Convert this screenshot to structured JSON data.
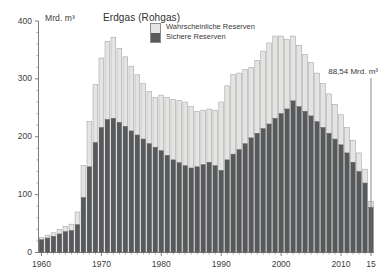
{
  "chart": {
    "title": "Erdgas (Rohgas)",
    "unit_label": "Mrd. m³",
    "annotation": "88,54 Mrd. m³",
    "legend": {
      "items": [
        {
          "label": "Wahrscheinliche Reserven",
          "color": "#e4e4e2",
          "key": "wahrscheinliche"
        },
        {
          "label": "Sichere Reserven",
          "color": "#58595b",
          "key": "sichere"
        }
      ]
    },
    "axis": {
      "y_ticks": [
        "0",
        "100",
        "200",
        "300",
        "400"
      ],
      "x_ticks": [
        "1960",
        "1970",
        "1980",
        "1990",
        "2000",
        "2010",
        "15"
      ]
    },
    "colors": {
      "light": "#e4e4e2",
      "dark": "#58595b",
      "bar_stroke": "#9a9a9a",
      "axis": "#6e6e6e",
      "text": "#3a3a3a"
    }
  },
  "chart_data": {
    "type": "bar",
    "stacked": true,
    "title": "Erdgas (Rohgas)",
    "xlabel": "",
    "ylabel": "Mrd. m³",
    "ylim": [
      0,
      400
    ],
    "yticks": [
      0,
      100,
      200,
      300,
      400
    ],
    "grid": false,
    "legend_position": "top-center",
    "annotations": [
      {
        "text": "88,54 Mrd. m³",
        "x": 2015,
        "note": "letzter Wert / Gesamtreserven 2015"
      }
    ],
    "categories": [
      1960,
      1961,
      1962,
      1963,
      1964,
      1965,
      1966,
      1967,
      1968,
      1969,
      1970,
      1971,
      1972,
      1973,
      1974,
      1975,
      1976,
      1977,
      1978,
      1979,
      1980,
      1981,
      1982,
      1983,
      1984,
      1985,
      1986,
      1987,
      1988,
      1989,
      1990,
      1991,
      1992,
      1993,
      1994,
      1995,
      1996,
      1997,
      1998,
      1999,
      2000,
      2001,
      2002,
      2003,
      2004,
      2005,
      2006,
      2007,
      2008,
      2009,
      2010,
      2011,
      2012,
      2013,
      2014,
      2015
    ],
    "series": [
      {
        "name": "Sichere Reserven",
        "color": "#58595b",
        "values": [
          22,
          25,
          28,
          32,
          36,
          38,
          48,
          95,
          148,
          190,
          216,
          230,
          232,
          225,
          218,
          210,
          203,
          196,
          188,
          182,
          176,
          168,
          160,
          155,
          150,
          146,
          148,
          152,
          156,
          150,
          142,
          160,
          170,
          178,
          188,
          198,
          206,
          214,
          222,
          232,
          240,
          248,
          262,
          252,
          244,
          236,
          226,
          216,
          206,
          196,
          186,
          172,
          156,
          140,
          120,
          78
        ]
      },
      {
        "name": "Wahrscheinliche Reserven",
        "color": "#e4e4e2",
        "values": [
          4,
          5,
          6,
          8,
          9,
          11,
          22,
          55,
          78,
          100,
          120,
          135,
          140,
          128,
          120,
          112,
          104,
          96,
          90,
          86,
          96,
          100,
          104,
          108,
          110,
          106,
          96,
          94,
          92,
          96,
          118,
          128,
          138,
          132,
          128,
          122,
          126,
          134,
          140,
          142,
          134,
          120,
          112,
          106,
          98,
          92,
          84,
          76,
          68,
          60,
          52,
          44,
          38,
          32,
          24,
          10
        ]
      }
    ]
  }
}
